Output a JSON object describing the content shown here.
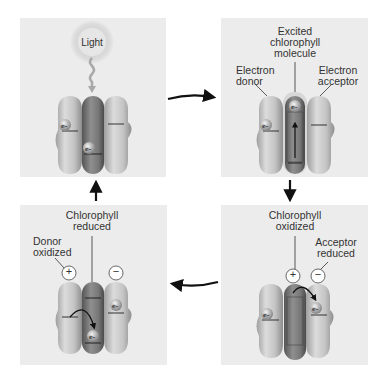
{
  "panels": {
    "top_left": {
      "light_label": "Light",
      "electron_label": "e-"
    },
    "top_right": {
      "excited_label_1": "Excited",
      "excited_label_2": "chlorophyll",
      "excited_label_3": "molecule",
      "donor_label_1": "Electron",
      "donor_label_2": "donor",
      "acceptor_label_1": "Electron",
      "acceptor_label_2": "acceptor"
    },
    "bottom_right": {
      "chl_label_1": "Chlorophyll",
      "chl_label_2": "oxidized",
      "acceptor_label_1": "Acceptor",
      "acceptor_label_2": "reduced",
      "plus_sign": "+",
      "minus_sign": "−"
    },
    "bottom_left": {
      "chl_label_1": "Chlorophyll",
      "chl_label_2": "reduced",
      "donor_label_1": "Donor",
      "donor_label_2": "oxidized",
      "plus_sign": "+",
      "minus_sign": "−"
    }
  },
  "colors": {
    "panel_bg": "#ececec",
    "protein_light": "#c8c8c8",
    "protein_dark": "#7a7a7a",
    "arrow": "#111111"
  },
  "cycle_arrows": [
    "top-left to top-right",
    "top-right to bottom-right",
    "bottom-right to bottom-left",
    "bottom-left to top-left"
  ]
}
